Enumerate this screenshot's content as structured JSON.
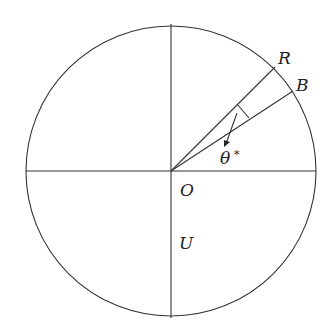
{
  "diagram": {
    "title": "",
    "labels": {
      "R": "R",
      "B": "B",
      "theta": "θ",
      "theta_star": "*",
      "O": "O",
      "U": "U"
    },
    "colors": {
      "stroke": "#333333",
      "text": "#222222",
      "background": "#ffffff"
    }
  }
}
